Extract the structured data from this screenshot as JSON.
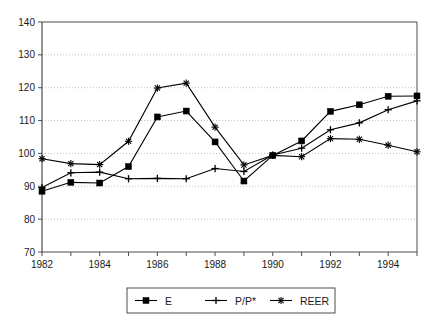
{
  "chart_data": {
    "type": "line",
    "title": "",
    "subtitle": "",
    "xlabel": "",
    "ylabel": "",
    "x": [
      1982,
      1983,
      1984,
      1985,
      1986,
      1987,
      1988,
      1989,
      1990,
      1991,
      1992,
      1993,
      1994,
      1995
    ],
    "xtick_labels": [
      "1982",
      "1984",
      "1986",
      "1988",
      "1990",
      "1992",
      "1994"
    ],
    "xtick_values": [
      1982,
      1984,
      1986,
      1988,
      1990,
      1992,
      1994
    ],
    "ytick_labels": [
      "70",
      "80",
      "90",
      "100",
      "110",
      "120",
      "130",
      "140"
    ],
    "ytick_values": [
      70,
      80,
      90,
      100,
      110,
      120,
      130,
      140
    ],
    "xlim": [
      1982,
      1995
    ],
    "ylim": [
      70,
      140
    ],
    "grid": "horizontal",
    "legend_position": "bottom",
    "series": [
      {
        "name": "E",
        "marker": "square",
        "color": "#000000",
        "values": [
          88.5,
          91.2,
          91.0,
          96.0,
          111.1,
          112.9,
          103.5,
          91.6,
          99.4,
          103.8,
          112.8,
          114.8,
          117.4,
          117.5
        ]
      },
      {
        "name": "P/P*",
        "marker": "plus",
        "color": "#000000",
        "values": [
          89.6,
          94.1,
          94.3,
          92.3,
          92.4,
          92.3,
          95.4,
          94.5,
          99.5,
          101.6,
          107.2,
          109.3,
          113.3,
          116.0
        ]
      },
      {
        "name": "REER",
        "marker": "asterisk",
        "color": "#000000",
        "values": [
          98.4,
          96.9,
          96.6,
          103.7,
          119.9,
          121.4,
          108.0,
          96.5,
          99.4,
          99.0,
          104.5,
          104.3,
          102.5,
          100.5
        ]
      }
    ]
  },
  "legend": {
    "entries": [
      {
        "label": "E",
        "marker": "square"
      },
      {
        "label": "P/P*",
        "marker": "plus"
      },
      {
        "label": "REER",
        "marker": "asterisk"
      }
    ]
  },
  "colors": {
    "axis": "#4d4d4d",
    "grid": "#b3b3b3",
    "series": "#000000",
    "background": "#ffffff",
    "text": "#1a1a1a"
  }
}
